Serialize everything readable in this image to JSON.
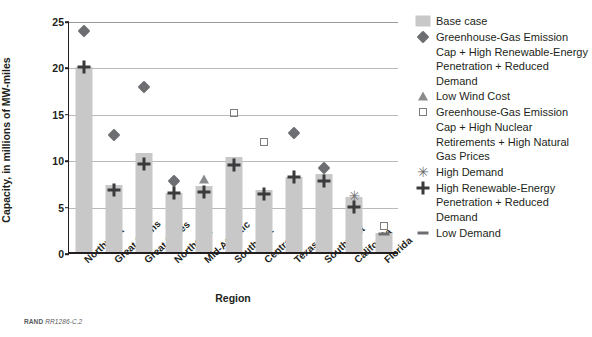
{
  "chart_data": {
    "type": "bar",
    "title": "",
    "xlabel": "Region",
    "ylabel": "Capacity, in millions of MW-miles",
    "ylim": [
      0,
      25
    ],
    "yticks": [
      0,
      5,
      10,
      15,
      20,
      25
    ],
    "grid": "horizontal",
    "legend_position": "right",
    "categories": [
      "Northwest",
      "Great Plains",
      "Great Lakes",
      "Northeast",
      "Mid-Atlantic",
      "Southeast",
      "Central",
      "Texas",
      "Southwest",
      "California",
      "Florida"
    ],
    "series": [
      {
        "name": "Base case",
        "marker": "bar-swatch",
        "color": "#c8c8c8",
        "values": [
          19.9,
          7.2,
          10.7,
          6.4,
          7.1,
          10.2,
          6.7,
          8.1,
          8.4,
          5.9,
          2.0
        ]
      },
      {
        "name": "Greenhouse-Gas Emission Cap + High Renewable-Energy Penetration + Reduced Demand",
        "marker": "diamond",
        "color": "#6d6e71",
        "values": [
          23.8,
          12.6,
          17.8,
          7.6,
          null,
          null,
          null,
          12.8,
          9.0,
          null,
          null
        ]
      },
      {
        "name": "Low Wind Cost",
        "marker": "triangle",
        "color": "#8a8b8d",
        "values": [
          null,
          null,
          null,
          null,
          7.9,
          null,
          null,
          null,
          null,
          null,
          null
        ]
      },
      {
        "name": "Greenhouse-Gas Emission Cap + High Nuclear Retirements + High Natural Gas Prices",
        "marker": "open-square",
        "color": "#7b7c7e",
        "values": [
          null,
          null,
          null,
          null,
          null,
          15.0,
          11.9,
          null,
          null,
          null,
          2.8
        ]
      },
      {
        "name": "High Demand",
        "marker": "asterisk",
        "color": "#6d6e71",
        "values": [
          null,
          null,
          null,
          null,
          null,
          null,
          null,
          null,
          null,
          6.0,
          null
        ]
      },
      {
        "name": "High Renewable-Energy Penetration + Reduced Demand",
        "marker": "plus",
        "color": "#3b3b3d",
        "values": [
          19.9,
          6.7,
          9.5,
          6.4,
          6.5,
          9.4,
          6.2,
          8.1,
          7.6,
          4.8,
          null
        ]
      },
      {
        "name": "Low Demand",
        "marker": "dash",
        "color": "#6d6e71",
        "values": [
          null,
          null,
          null,
          null,
          null,
          null,
          null,
          null,
          null,
          null,
          1.9
        ]
      }
    ]
  },
  "axis": {
    "y_title": "Capacity, in millions of MW-miles",
    "x_title": "Region",
    "y_ticks": [
      "0",
      "5",
      "10",
      "15",
      "20",
      "25"
    ],
    "x_ticks": [
      "Northwest",
      "Great Plains",
      "Great Lakes",
      "Northeast",
      "Mid-Atlantic",
      "Southeast",
      "Central",
      "Texas",
      "Southwest",
      "California",
      "Florida"
    ]
  },
  "legend": {
    "items": [
      {
        "marker": "bar-swatch-icon",
        "label": "Base case"
      },
      {
        "marker": "diamond-icon",
        "label": "Greenhouse-Gas Emission Cap + High Renewable-Energy Penetration + Reduced Demand"
      },
      {
        "marker": "triangle-icon",
        "label": "Low Wind Cost"
      },
      {
        "marker": "open-square-icon",
        "label": "Greenhouse-Gas Emission Cap + High Nuclear Retirements + High Natural Gas Prices"
      },
      {
        "marker": "asterisk-icon",
        "label": "High Demand"
      },
      {
        "marker": "plus-icon",
        "label": "High Renewable-Energy Penetration + Reduced Demand"
      },
      {
        "marker": "dash-icon",
        "label": "Low Demand"
      }
    ]
  },
  "caption": {
    "source": "RAND",
    "identifier": "RR1286-C.2"
  }
}
